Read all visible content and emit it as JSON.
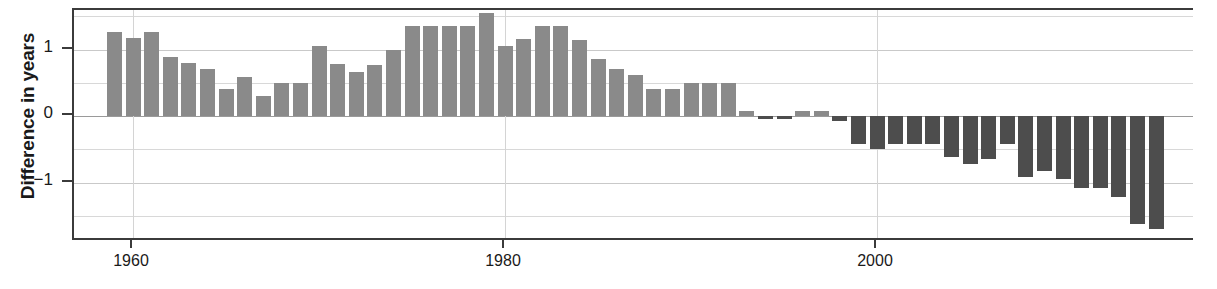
{
  "chart_data": {
    "type": "bar",
    "title": "",
    "subtitle": "",
    "xlabel": "",
    "ylabel": "Difference in years",
    "xlim": [
      1958.4,
      2015.6
    ],
    "ylim": [
      -1.83,
      1.65
    ],
    "grid": true,
    "legend": false,
    "y_ticks": [
      1,
      0,
      -1
    ],
    "y_tick_labels": [
      "1",
      "0",
      "−1"
    ],
    "y_minor_ticks": [
      1.5,
      0.5,
      -0.5,
      -1.5
    ],
    "x_ticks": [
      1960,
      1980,
      2000
    ],
    "x_tick_labels": [
      "1960",
      "1980",
      "2000"
    ],
    "colors": {
      "positive_bar": "#8a8a8a",
      "negative_bar": "#4d4d4d",
      "axis": "#3b3b3b",
      "gridline": "#d8d8d8",
      "text": "#1a1a1a",
      "background": "#ffffff"
    },
    "categories": [
      1959,
      1960,
      1961,
      1962,
      1963,
      1964,
      1965,
      1966,
      1967,
      1968,
      1969,
      1970,
      1971,
      1972,
      1973,
      1974,
      1975,
      1976,
      1977,
      1978,
      1979,
      1980,
      1981,
      1982,
      1983,
      1984,
      1985,
      1986,
      1987,
      1988,
      1989,
      1990,
      1991,
      1992,
      1993,
      1994,
      1995,
      1996,
      1997,
      1998,
      1999,
      2000,
      2001,
      2002,
      2003,
      2004,
      2005,
      2006,
      2007,
      2008,
      2009,
      2010,
      2011,
      2012,
      2013,
      2014,
      2015
    ],
    "values": [
      1.26,
      1.18,
      1.26,
      0.89,
      0.79,
      0.7,
      0.4,
      0.58,
      0.3,
      0.5,
      0.5,
      1.06,
      0.78,
      0.66,
      0.76,
      1.0,
      1.36,
      1.36,
      1.36,
      1.36,
      1.55,
      1.05,
      1.16,
      1.36,
      1.36,
      1.15,
      0.85,
      0.7,
      0.62,
      0.4,
      0.4,
      0.5,
      0.5,
      0.5,
      0.08,
      -0.05,
      -0.05,
      0.08,
      0.08,
      -0.08,
      -0.42,
      -0.5,
      -0.42,
      -0.42,
      -0.42,
      -0.62,
      -0.72,
      -0.65,
      -0.42,
      -0.92,
      -0.82,
      -0.95,
      -1.08,
      -1.08,
      -1.22,
      -1.62,
      -1.7
    ],
    "series_name": "Difference in years"
  },
  "axis": {
    "ylabel_text": "Difference in years"
  }
}
